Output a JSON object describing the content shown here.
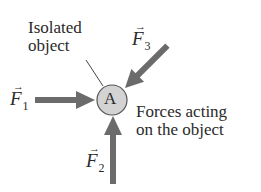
{
  "header": {
    "cut_text": "...ng a free-body diagram"
  },
  "labels": {
    "isolated_line1": "Isolated",
    "isolated_line2": "object",
    "forces_line1": "Forces acting",
    "forces_line2": "on the object",
    "object": "A"
  },
  "forces": [
    {
      "symbol": "F",
      "subscript": "1",
      "direction": "right"
    },
    {
      "symbol": "F",
      "subscript": "2",
      "direction": "up"
    },
    {
      "symbol": "F",
      "subscript": "3",
      "direction": "down-left"
    }
  ],
  "colors": {
    "arrow": "#6b6b6b",
    "circle_fill": "#d3d3d3",
    "circle_stroke": "#555555",
    "text": "#2a2a2a"
  }
}
